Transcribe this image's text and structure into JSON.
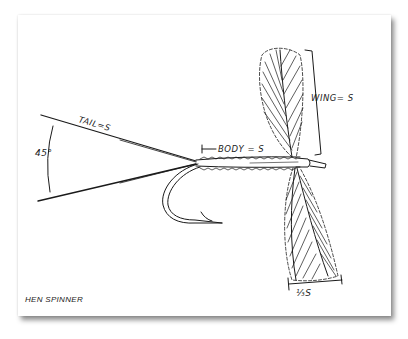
{
  "figure": {
    "title": "HEN SPINNER",
    "labels": {
      "tail": "TAIL=S",
      "angle": "45°",
      "body": "BODY = S",
      "wing": "WING= S",
      "hackle": "⅓S"
    },
    "colors": {
      "ink": "#1a1a1a",
      "paper": "#ffffff"
    }
  }
}
